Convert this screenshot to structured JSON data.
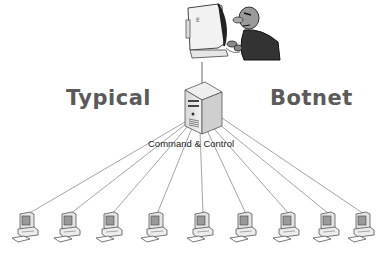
{
  "diagram": {
    "title_left": "Typical",
    "title_right": "Botnet",
    "server_label": "Command & Control",
    "nodes": {
      "attacker": {
        "icon": "hacker-at-computer-icon"
      },
      "server": {
        "icon": "server-tower-icon"
      },
      "clients": [
        {
          "icon": "client-pc-icon",
          "x": 22
        },
        {
          "icon": "client-pc-icon",
          "x": 65
        },
        {
          "icon": "client-pc-icon",
          "x": 106
        },
        {
          "icon": "client-pc-icon",
          "x": 151
        },
        {
          "icon": "client-pc-icon",
          "x": 197
        },
        {
          "icon": "client-pc-icon",
          "x": 240
        },
        {
          "icon": "client-pc-icon",
          "x": 283
        },
        {
          "icon": "client-pc-icon",
          "x": 323
        },
        {
          "icon": "client-pc-icon",
          "x": 360
        }
      ]
    },
    "edges": "attacker connects to server; server connects to each of 9 clients"
  }
}
